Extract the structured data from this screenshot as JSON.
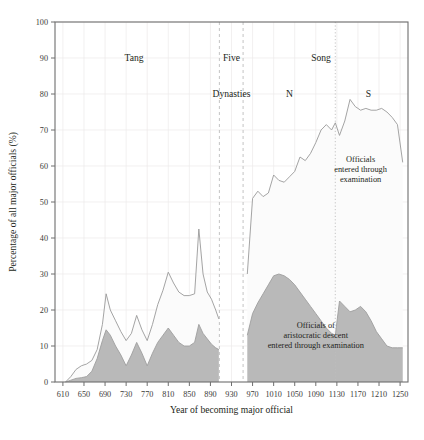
{
  "chart_data": {
    "type": "area",
    "title": "",
    "xlabel": "Year of becoming major official",
    "ylabel": "Percentage of all major officials (%)",
    "xlim": [
      595,
      1265
    ],
    "ylim": [
      0,
      100
    ],
    "grid": true,
    "legend_position": "none",
    "x_ticks": [
      610,
      650,
      690,
      730,
      770,
      810,
      850,
      890,
      930,
      970,
      1010,
      1050,
      1090,
      1130,
      1170,
      1210,
      1250
    ],
    "y_ticks": [
      0,
      10,
      20,
      30,
      40,
      50,
      60,
      70,
      80,
      90,
      100
    ],
    "series": [
      {
        "name": "Officials entered through examination",
        "fill": "#fbfbfb",
        "stroke": "#9a9a9a",
        "x": [
          615,
          625,
          635,
          645,
          655,
          665,
          675,
          685,
          692,
          700,
          710,
          720,
          730,
          740,
          750,
          760,
          770,
          780,
          790,
          800,
          810,
          820,
          830,
          840,
          850,
          860,
          868,
          876,
          884,
          892,
          900,
          906,
          960,
          970,
          980,
          990,
          1000,
          1010,
          1020,
          1030,
          1040,
          1050,
          1060,
          1070,
          1080,
          1090,
          1100,
          1110,
          1120,
          1127,
          1135,
          1145,
          1155,
          1165,
          1175,
          1185,
          1195,
          1205,
          1215,
          1225,
          1235,
          1245,
          1255
        ],
        "values": [
          0,
          1.5,
          3.5,
          4.5,
          5.0,
          6.0,
          9.0,
          16.0,
          24.5,
          20.0,
          17.0,
          14.0,
          11.5,
          13.5,
          18.5,
          14.5,
          11.5,
          16.0,
          21.5,
          25.5,
          30.5,
          27.5,
          25.0,
          24.0,
          24.0,
          24.5,
          42.5,
          30.0,
          25.0,
          23.0,
          20.0,
          17.5,
          30.0,
          51.0,
          53.0,
          51.5,
          52.5,
          57.5,
          56.0,
          55.5,
          57.0,
          58.5,
          62.5,
          61.5,
          63.5,
          66.5,
          70.0,
          71.5,
          70.0,
          72.0,
          68.5,
          72.5,
          78.5,
          76.5,
          75.5,
          76.0,
          75.5,
          75.5,
          76.0,
          75.0,
          73.5,
          71.5,
          61.0
        ]
      },
      {
        "name": "Officials of aristocratic descent entered through examination",
        "fill": "#b9b9b9",
        "stroke": "#9e9e9e",
        "x": [
          615,
          625,
          635,
          645,
          655,
          665,
          675,
          685,
          692,
          700,
          710,
          720,
          730,
          740,
          750,
          760,
          770,
          780,
          790,
          800,
          810,
          820,
          830,
          840,
          850,
          860,
          868,
          876,
          884,
          892,
          900,
          906,
          960,
          970,
          980,
          990,
          1000,
          1010,
          1020,
          1030,
          1040,
          1050,
          1060,
          1070,
          1080,
          1090,
          1100,
          1110,
          1120,
          1127,
          1135,
          1145,
          1155,
          1165,
          1175,
          1185,
          1195,
          1205,
          1215,
          1225,
          1235,
          1245,
          1255
        ],
        "values": [
          0,
          0.5,
          1.0,
          1.2,
          1.5,
          3.0,
          6.5,
          11.5,
          14.5,
          13.0,
          10.0,
          7.5,
          4.5,
          7.5,
          11.0,
          8.0,
          4.5,
          8.0,
          11.0,
          13.0,
          15.0,
          13.0,
          11.0,
          10.0,
          10.0,
          11.0,
          16.0,
          13.5,
          12.0,
          10.5,
          9.5,
          9.0,
          13.0,
          19.0,
          22.0,
          24.5,
          27.0,
          29.5,
          30.0,
          29.5,
          28.5,
          27.0,
          25.0,
          23.0,
          21.0,
          19.0,
          17.0,
          15.0,
          13.5,
          13.0,
          22.5,
          21.0,
          19.5,
          20.0,
          21.0,
          19.5,
          17.0,
          14.0,
          12.0,
          10.0,
          9.5,
          9.5,
          9.5
        ]
      }
    ],
    "era_dividers": [
      {
        "x": 907,
        "style": "dashed"
      },
      {
        "x": 952,
        "style": "dashed"
      },
      {
        "x": 1127,
        "style": "dotted"
      }
    ],
    "era_labels": [
      {
        "text": "Tang",
        "x": 745,
        "y": 90
      },
      {
        "text": "Five",
        "x": 930,
        "y": 90
      },
      {
        "text": "Dynasties",
        "x": 930,
        "y": 80
      },
      {
        "text": "Song",
        "x": 1100,
        "y": 90
      },
      {
        "text": "N",
        "x": 1040,
        "y": 80
      },
      {
        "text": "S",
        "x": 1190,
        "y": 80
      }
    ],
    "annotations": [
      {
        "lines": [
          "Officials",
          "entered through",
          "examination"
        ],
        "x": 1175,
        "y": 61
      },
      {
        "lines": [
          "Officials of",
          "aristocratic descent",
          "entered through examination"
        ],
        "x": 1090,
        "y": 15
      }
    ]
  },
  "colors": {
    "axis": "#6e6e6e",
    "grid": "#eceaea",
    "dark_area": "#b9b9b9",
    "light_area": "#fbfbfb",
    "line": "#9a9a9a",
    "text": "#231f20",
    "divider": "#bdbdbd"
  }
}
